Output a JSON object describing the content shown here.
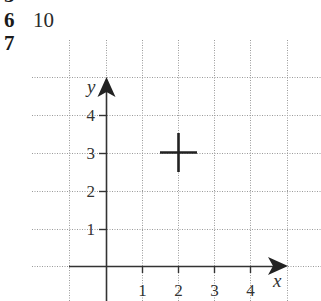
{
  "question_list": {
    "cropped_row": {
      "number": "5",
      "text": "",
      "note_visible": "partially cut off at top edge"
    },
    "rows": [
      {
        "number": "6",
        "answer": "10"
      },
      {
        "number": "7",
        "answer": ""
      }
    ]
  },
  "graph": {
    "x_axis_label": "x",
    "y_axis_label": "y",
    "x_tick_labels": [
      "1",
      "2",
      "3",
      "4"
    ],
    "y_tick_labels": [
      "1",
      "2",
      "3",
      "4"
    ],
    "grid_style": "dotted",
    "marker": {
      "shape": "cross",
      "x": 2,
      "y": 3
    },
    "colors": {
      "axis": "#333333",
      "grid": "#9a9a9a",
      "marker": "#222222",
      "label": "#333333"
    }
  }
}
